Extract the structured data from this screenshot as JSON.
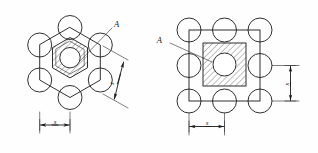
{
  "figure": {
    "background_color": "#fefefe",
    "line_color": "#1a1a1a",
    "hatch_color": "#1f1f1f"
  },
  "left_figure": {
    "name": "hexagonal-array-detail",
    "section_label": "A",
    "pitch_label": "s",
    "diagonal_pitch_label": "s",
    "circle_count": 6,
    "arrangement": "hexagonal",
    "center_feature": "hatched-hexagonal-ring-with-round-bore"
  },
  "right_figure": {
    "name": "square-array-detail",
    "section_label": "A",
    "pitch_label": "s",
    "vertical_pitch_label": "s",
    "circle_count": 8,
    "arrangement": "square",
    "center_feature": "hatched-square-with-round-bore"
  }
}
